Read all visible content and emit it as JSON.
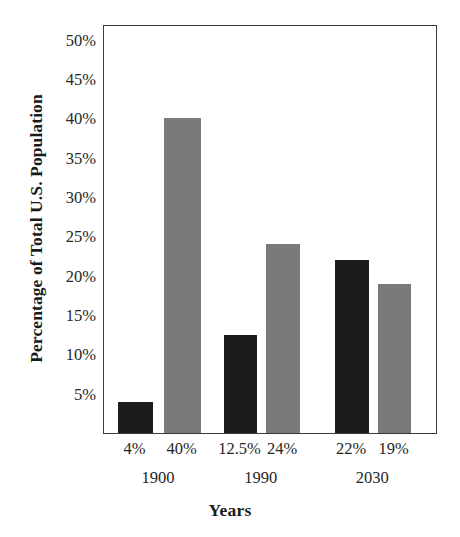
{
  "chart_data": {
    "type": "bar",
    "title": "",
    "xlabel": "Years",
    "ylabel": "Percentage of Total U.S. Population",
    "ylim": [
      0,
      52
    ],
    "grid": false,
    "legend": false,
    "categories": [
      "1900",
      "1990",
      "2030"
    ],
    "y_ticks": [
      "5%",
      "10%",
      "15%",
      "20%",
      "25%",
      "30%",
      "35%",
      "40%",
      "45%",
      "50%"
    ],
    "y_tick_values": [
      5,
      10,
      15,
      20,
      25,
      30,
      35,
      40,
      45,
      50
    ],
    "series": [
      {
        "name": "dark",
        "color": "#1c1c1c",
        "values": [
          4,
          12.5,
          22
        ],
        "labels": [
          "4%",
          "12.5%",
          "22%"
        ]
      },
      {
        "name": "gray",
        "color": "#7a7a7a",
        "values": [
          40,
          24,
          19
        ],
        "labels": [
          "40%",
          "24%",
          "19%"
        ]
      }
    ],
    "bars": [
      {
        "label": "4%",
        "value": 4,
        "group": "1900",
        "color": "#1c1c1c"
      },
      {
        "label": "40%",
        "value": 40,
        "group": "1900",
        "color": "#7a7a7a"
      },
      {
        "label": "12.5%",
        "value": 12.5,
        "group": "1990",
        "color": "#1c1c1c"
      },
      {
        "label": "24%",
        "value": 24,
        "group": "1990",
        "color": "#7a7a7a"
      },
      {
        "label": "22%",
        "value": 22,
        "group": "2030",
        "color": "#1c1c1c"
      },
      {
        "label": "19%",
        "value": 19,
        "group": "2030",
        "color": "#7a7a7a"
      }
    ]
  },
  "colors": {
    "dark_bar": "#1c1c1c",
    "gray_bar": "#7a7a7a",
    "frame": "#3a3a3a",
    "background": "#ffffff",
    "text": "#262626"
  }
}
